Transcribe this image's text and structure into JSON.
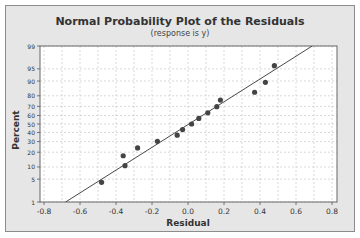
{
  "chart_data": {
    "type": "scatter",
    "title": "Normal Probability Plot of the Residuals",
    "subtitle": "(response is y)",
    "xlabel": "Residual",
    "ylabel": "Percent",
    "xlim": [
      -0.8,
      0.8
    ],
    "ylim": [
      1,
      99
    ],
    "x_ticks": [
      "-0.8",
      "-0.6",
      "-0.4",
      "-0.2",
      "0.0",
      "0.2",
      "0.4",
      "0.6",
      "0.8"
    ],
    "y_ticks": [
      "1",
      "5",
      "10",
      "20",
      "30",
      "40",
      "50",
      "60",
      "70",
      "80",
      "90",
      "95",
      "99"
    ],
    "y_scale": "normal probability",
    "grid": true,
    "series": [
      {
        "name": "Residuals",
        "x": [
          -0.48,
          -0.35,
          -0.36,
          -0.28,
          -0.17,
          -0.06,
          -0.03,
          0.02,
          0.06,
          0.11,
          0.16,
          0.18,
          0.37,
          0.43,
          0.48
        ],
        "y": [
          4.1,
          10.7,
          17.2,
          23.8,
          30.3,
          36.9,
          43.4,
          50.0,
          56.6,
          63.1,
          69.7,
          76.2,
          82.8,
          89.3,
          95.9
        ]
      }
    ],
    "fit_line": {
      "x": [
        -0.68,
        0.69
      ],
      "y": [
        1,
        99
      ]
    }
  },
  "labels": {
    "title": "Normal Probability Plot of the Residuals",
    "subtitle": "(response is y)",
    "xlabel": "Residual",
    "ylabel": "Percent"
  }
}
